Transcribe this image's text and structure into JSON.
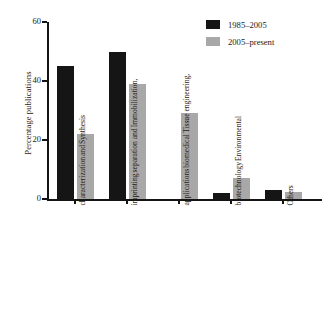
{
  "chart_data": {
    "type": "bar",
    "title": "",
    "xlabel": "",
    "ylabel": "Percentage publications",
    "ylim": [
      0,
      60
    ],
    "yticks": [
      0,
      20,
      40,
      60
    ],
    "grid": false,
    "legend_position": "top-right",
    "categories": [
      "Synthesis and characterization",
      "Immobilization, separation and imprinting",
      "Tissue engineering, biomedical applications",
      "Environmental biotechnology",
      "Others"
    ],
    "category_lines": [
      [
        "Synthesis",
        "and",
        "characterization"
      ],
      [
        "Immobilization,",
        "separation and",
        "imprinting"
      ],
      [
        "Tissue engineering,",
        "biomedical",
        "applications"
      ],
      [
        "Environmental",
        "biotechnology"
      ],
      [
        "Others"
      ]
    ],
    "series": [
      {
        "name": "1985–2005",
        "color": "#151515",
        "values": [
          45,
          50,
          0,
          2,
          3
        ]
      },
      {
        "name": "2005–present",
        "color": "#a8a8a8",
        "values": [
          22,
          39,
          29,
          7,
          2.5
        ]
      }
    ]
  },
  "legend": {
    "items": [
      {
        "label": "1985–2005",
        "swatch": "black"
      },
      {
        "label": "2005–present",
        "swatch": "gray"
      }
    ]
  },
  "axis": {
    "y_title": "Percentage publications",
    "y_tick_labels": [
      "0",
      "20",
      "40",
      "60"
    ]
  }
}
